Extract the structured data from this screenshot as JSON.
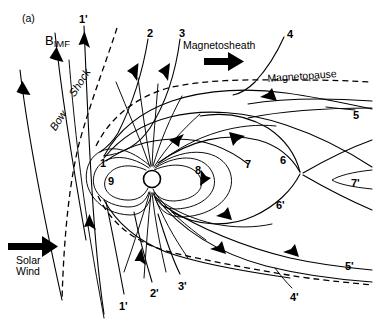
{
  "figure": {
    "panel_label": "(a)",
    "background_color": "#ffffff",
    "line_color": "#000000"
  },
  "annotations": {
    "bimf_symbol": "B",
    "bimf_subscript": "IMF",
    "bow": "Bow",
    "shock": "Shock",
    "magnetosheath": "Magnetosheath",
    "magnetopause": "Magnetopause",
    "solar_wind_line1": "Solar",
    "solar_wind_line2": "Wind"
  },
  "field_line_labels": [
    {
      "id": "l1p_top",
      "text": "1'",
      "x": 79,
      "y": 14
    },
    {
      "id": "l2",
      "text": "2",
      "x": 147,
      "y": 28
    },
    {
      "id": "l3",
      "text": "3",
      "x": 179,
      "y": 28
    },
    {
      "id": "l4",
      "text": "4",
      "x": 287,
      "y": 29
    },
    {
      "id": "l5",
      "text": "5",
      "x": 353,
      "y": 110
    },
    {
      "id": "l1",
      "text": "1",
      "x": 100,
      "y": 158
    },
    {
      "id": "l9",
      "text": "9",
      "x": 108,
      "y": 176
    },
    {
      "id": "l8",
      "text": "8",
      "x": 195,
      "y": 165
    },
    {
      "id": "l7",
      "text": "7",
      "x": 245,
      "y": 159
    },
    {
      "id": "l6",
      "text": "6",
      "x": 280,
      "y": 155
    },
    {
      "id": "l7p",
      "text": "7'",
      "x": 351,
      "y": 178
    },
    {
      "id": "l6p",
      "text": "6'",
      "x": 276,
      "y": 200
    },
    {
      "id": "l5p",
      "text": "5'",
      "x": 345,
      "y": 261
    },
    {
      "id": "l1p_bot",
      "text": "1'",
      "x": 119,
      "y": 301
    },
    {
      "id": "l2p",
      "text": "2'",
      "x": 150,
      "y": 288
    },
    {
      "id": "l3p",
      "text": "3'",
      "x": 178,
      "y": 281
    },
    {
      "id": "l4p",
      "text": "4'",
      "x": 290,
      "y": 292
    }
  ],
  "regions": [
    {
      "name": "solar-wind",
      "description": "Inflowing solar wind at left, arrow pointing sunward-to-Earth (rightward)"
    },
    {
      "name": "bow-shock",
      "description": "Dashed curve standing upstream of the magnetopause"
    },
    {
      "name": "magnetosheath",
      "description": "Shocked flow region between bow shock and magnetopause, flow arrow rightward"
    },
    {
      "name": "magnetopause",
      "description": "Dashed boundary enclosing the magnetosphere"
    },
    {
      "name": "magnetosphere",
      "description": "Closed dipole-like field lines around Earth"
    },
    {
      "name": "magnetotail",
      "description": "Stretched tail lobes with X-type neutral line downstream"
    }
  ]
}
